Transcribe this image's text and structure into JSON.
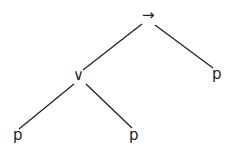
{
  "diagram": {
    "type": "syntax-tree",
    "nodes": [
      {
        "id": "root",
        "label": "→",
        "role": "implication"
      },
      {
        "id": "or",
        "label": "∨",
        "role": "disjunction"
      },
      {
        "id": "p_right",
        "label": "p",
        "role": "atom"
      },
      {
        "id": "p_left",
        "label": "p",
        "role": "atom"
      },
      {
        "id": "p_mid",
        "label": "p",
        "role": "atom"
      }
    ],
    "edges": [
      {
        "from": "root",
        "to": "or"
      },
      {
        "from": "root",
        "to": "p_right"
      },
      {
        "from": "or",
        "to": "p_left"
      },
      {
        "from": "or",
        "to": "p_mid"
      }
    ],
    "formula": "(p ∨ p) → p",
    "line_color": "#222222"
  }
}
